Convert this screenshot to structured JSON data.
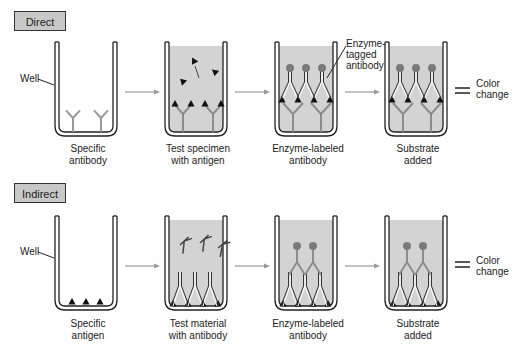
{
  "panels": [
    {
      "title": "Direct",
      "well_label": "Well",
      "antigen_label": "Antigen",
      "enzyme_label": "Enzyme-\ntagged\nantibody",
      "result": "Color\nchange",
      "steps": [
        "Specific\nantibody",
        "Test specimen\nwith antigen",
        "Enzyme-labeled\nantibody",
        "Substrate\nadded"
      ]
    },
    {
      "title": "Indirect",
      "well_label": "Well",
      "result": "Color\nchange",
      "steps": [
        "Specific\nantigen",
        "Test material\nwith antibody",
        "Enzyme-labeled\nantibody",
        "Substrate\nadded"
      ]
    }
  ],
  "colors": {
    "fill": "#d3d3d3",
    "antibody": "#8c8c8c",
    "enzyme": "#7a7a7a",
    "antigen": "#111111",
    "arrow": "#9a9a9a"
  }
}
